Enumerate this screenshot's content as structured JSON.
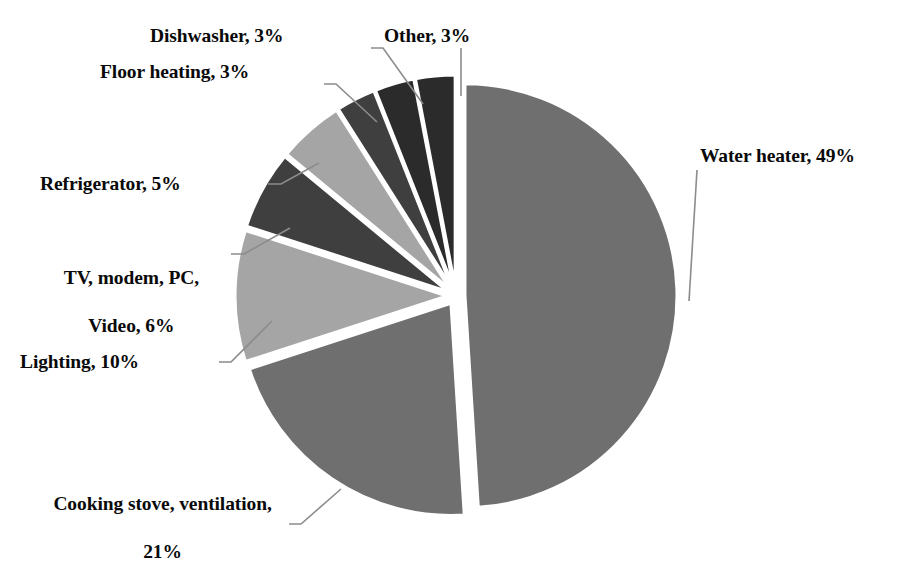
{
  "chart_data": {
    "type": "pie",
    "title": "",
    "subtitle": "",
    "xlabel": "",
    "ylabel": "",
    "legend_position": "none",
    "grid": false,
    "exploded": true,
    "value_unit": "%",
    "categories": [
      "Water heater",
      "Cooking stove, ventilation",
      "Lighting",
      "TV, modem, PC, Video",
      "Refrigerator",
      "Floor heating",
      "Dishwasher",
      "Other"
    ],
    "values": [
      49,
      21,
      10,
      6,
      5,
      3,
      3,
      3
    ],
    "colors": [
      "#6f6f6f",
      "#6f6f6f",
      "#a5a5a5",
      "#3f3f3f",
      "#a5a5a5",
      "#3f3f3f",
      "#2b2b2b",
      "#2b2b2b"
    ],
    "slices": [
      {
        "label": "Water heater",
        "value": 49,
        "value_text": "49%",
        "text": "Water heater, 49%",
        "color": "#6f6f6f"
      },
      {
        "label": "Cooking stove, ventilation",
        "value": 21,
        "value_text": "21%",
        "text": "Cooking stove, ventilation, 21%",
        "color": "#6f6f6f"
      },
      {
        "label": "Lighting",
        "value": 10,
        "value_text": "10%",
        "text": "Lighting, 10%",
        "color": "#a5a5a5"
      },
      {
        "label": "TV, modem, PC, Video",
        "value": 6,
        "value_text": "6%",
        "text": "TV, modem, PC, Video, 6%",
        "color": "#3f3f3f"
      },
      {
        "label": "Refrigerator",
        "value": 5,
        "value_text": "5%",
        "text": "Refrigerator, 5%",
        "color": "#a5a5a5"
      },
      {
        "label": "Floor heating",
        "value": 3,
        "value_text": "3%",
        "text": "Floor heating, 3%",
        "color": "#3f3f3f"
      },
      {
        "label": "Dishwasher",
        "value": 3,
        "value_text": "3%",
        "text": "Dishwasher, 3%",
        "color": "#2b2b2b"
      },
      {
        "label": "Other",
        "value": 3,
        "value_text": "3%",
        "text": "Other, 3%",
        "color": "#2b2b2b"
      }
    ]
  },
  "labels": {
    "water_heater": "Water heater, 49%",
    "cooking_stove_line1": "Cooking stove, ventilation,",
    "cooking_stove_line2": "21%",
    "lighting": "Lighting, 10%",
    "tv_line1": "TV, modem, PC,",
    "tv_line2": "Video, 6%",
    "refrigerator": "Refrigerator, 5%",
    "floor_heating": "Floor heating, 3%",
    "dishwasher": "Dishwasher, 3%",
    "other": "Other, 3%"
  },
  "style": {
    "background": "#ffffff",
    "text_color": "#0a0a0a",
    "leader_line_color": "#8c8c8c"
  }
}
